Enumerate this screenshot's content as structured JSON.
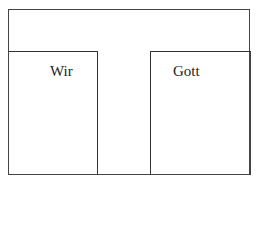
{
  "diagram": {
    "labels": {
      "left": "Wir",
      "right": "Gott"
    },
    "colors": {
      "line": "#333333",
      "background": "#ffffff"
    }
  }
}
